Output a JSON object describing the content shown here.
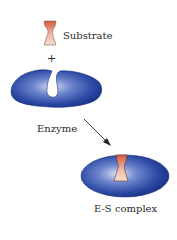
{
  "labels": {
    "substrate": "Substrate",
    "plus": "+",
    "enzyme": "Enzyme",
    "complex": "E-S complex"
  },
  "colors": {
    "enzyme_dark": "#1f3a8f",
    "enzyme_light": "#c9d3ef",
    "substrate_top": "#d9664a",
    "substrate_bottom": "#f3d6cb"
  }
}
